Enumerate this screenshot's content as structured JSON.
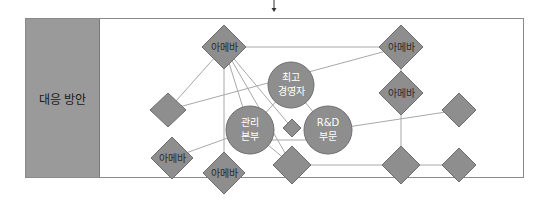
{
  "section_label": "대응 방안",
  "colors": {
    "node_fill": "#8e8e8e",
    "node_stroke": "#6e6e6e",
    "edge": "#a8a8a8",
    "panel": "#9a9a9a",
    "border": "#8a8a8a"
  },
  "nodes": {
    "ceo": {
      "line1": "최고",
      "line2": "경영자"
    },
    "admin": {
      "line1": "관리",
      "line2": "본부"
    },
    "rnd": {
      "line1": "R&D",
      "line2": "부문"
    },
    "amoeba_top_left": {
      "label": "아메바"
    },
    "amoeba_top_right": {
      "label": "아메바"
    },
    "amoeba_right_second": {
      "label": "아메바"
    },
    "amoeba_bottom_left": {
      "label": "아메바"
    },
    "amoeba_bottom": {
      "label": "아메바"
    }
  }
}
